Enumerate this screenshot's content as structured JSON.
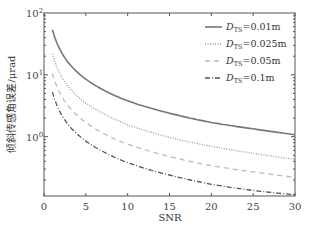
{
  "chart_data": {
    "type": "line",
    "title": "",
    "xlabel": "SNR",
    "ylabel": "倾斜传感角误差/μrad",
    "xlim": [
      0,
      30
    ],
    "ylim": [
      0.11,
      100
    ],
    "yscale": "log",
    "xticks": [
      "0",
      "5",
      "10",
      "15",
      "20",
      "25",
      "30"
    ],
    "yticks": [
      "10^0",
      "10^1",
      "10^2"
    ],
    "grid": false,
    "legend_position": "upper right",
    "x": [
      1,
      2,
      3,
      5,
      7,
      10,
      15,
      20,
      25,
      30
    ],
    "series": [
      {
        "name": "D_TS=0.01m",
        "style": "solid",
        "color": "#777777",
        "values": [
          54,
          24.4,
          15.2,
          8.5,
          5.8,
          3.8,
          2.4,
          1.7,
          1.34,
          1.08
        ]
      },
      {
        "name": "D_TS=0.025m",
        "style": "dotted",
        "color": "#999999",
        "values": [
          22,
          9.9,
          6.2,
          3.5,
          2.4,
          1.56,
          0.98,
          0.7,
          0.54,
          0.43
        ]
      },
      {
        "name": "D_TS=0.05m",
        "style": "dashed",
        "color": "#bbbbbb",
        "values": [
          10.5,
          4.8,
          3.0,
          1.7,
          1.15,
          0.76,
          0.48,
          0.34,
          0.27,
          0.22
        ]
      },
      {
        "name": "D_TS=0.1m",
        "style": "dashdot",
        "color": "#555555",
        "values": [
          5.3,
          2.4,
          1.5,
          0.85,
          0.58,
          0.38,
          0.24,
          0.17,
          0.135,
          0.115
        ]
      }
    ]
  },
  "axes": {
    "xlabel": "SNR",
    "ylabel": "倾斜传感角误差/μrad",
    "xticks": [
      "0",
      "5",
      "10",
      "15",
      "20",
      "25",
      "30"
    ]
  },
  "legend": [
    {
      "main": "D",
      "sub": "TS",
      "rest": "=0.01m"
    },
    {
      "main": "D",
      "sub": "TS",
      "rest": "=0.025m"
    },
    {
      "main": "D",
      "sub": "TS",
      "rest": "=0.05m"
    },
    {
      "main": "D",
      "sub": "TS",
      "rest": "=0.1m"
    }
  ]
}
